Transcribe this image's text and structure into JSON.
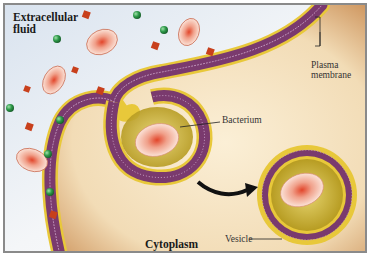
{
  "diagram": {
    "type": "biology-illustration",
    "labels": {
      "extracellular": "Extracellular",
      "extracellular2": "fluid",
      "plasma": "Plasma",
      "plasma2": "membrane",
      "bacterium": "Bacterium",
      "cytoplasm": "Cytoplasm",
      "vesicle": "Vesicle"
    },
    "colors": {
      "extracellular_bg": "#e8eef6",
      "cytoplasm_bg": "#f3dfbd",
      "membrane_purple": "#7a3a6e",
      "membrane_yellow": "#e8c83a",
      "vesicle_interior": "#c9b234",
      "bacterium_body": "#f1b6a0",
      "bacterium_core": "#e0502a",
      "green_particle": "#2e9a4a",
      "red_particle": "#c8401c",
      "arrow": "#111111"
    }
  }
}
